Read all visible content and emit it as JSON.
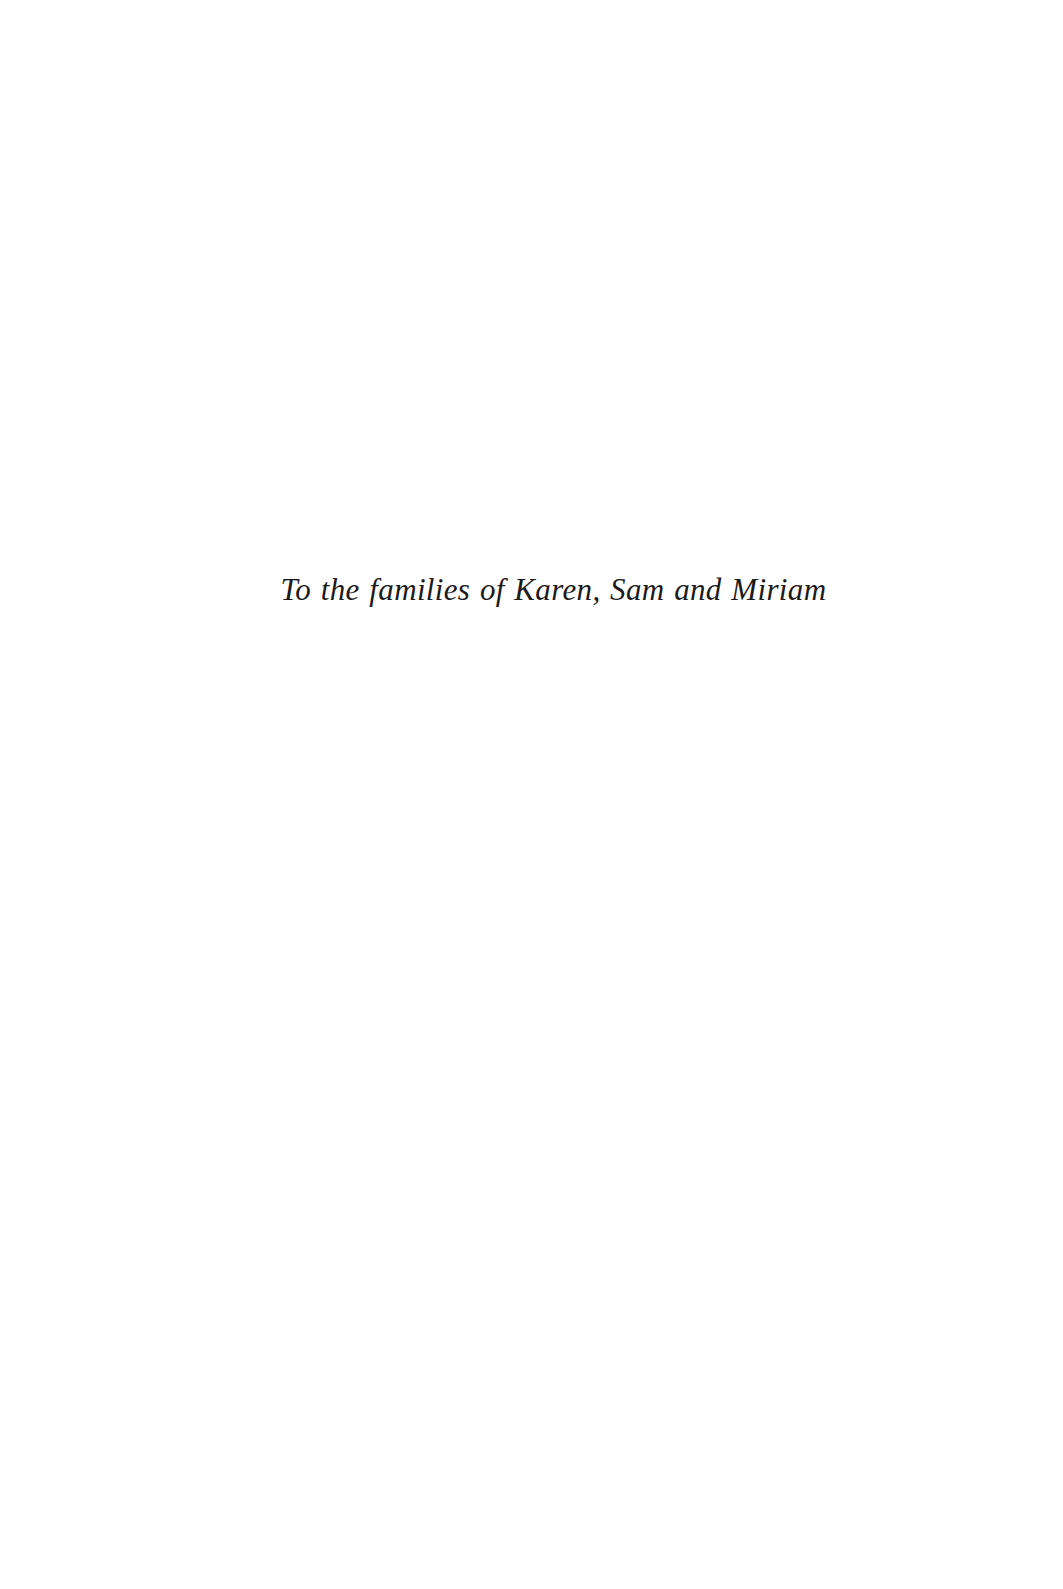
{
  "page": {
    "kind": "book-dedication-page",
    "background_color": "#ffffff",
    "text_color": "#1c1a1a"
  },
  "dedication": {
    "text": "To the families of Karen, Sam and Miriam"
  }
}
